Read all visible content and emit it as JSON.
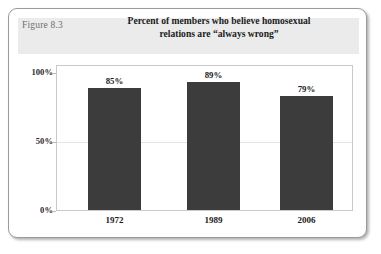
{
  "figure": {
    "label": "Figure 8.3",
    "title_line1": "Percent of members who believe homosexual",
    "title_line2": "relations are “always wrong”",
    "banner_color": "#ebebeb",
    "bar_color": "#3c3c3c",
    "card_border_color": "#9a9a9a"
  },
  "chart_data": {
    "type": "bar",
    "title": "Percent of members who believe homosexual relations are “always wrong”",
    "categories": [
      "1972",
      "1989",
      "2006"
    ],
    "values": [
      85,
      89,
      79
    ],
    "value_labels": [
      "85%",
      "89%",
      "79%"
    ],
    "xlabel": "",
    "ylabel": "",
    "ylim": [
      0,
      100
    ],
    "yticks": [
      0,
      50,
      100
    ],
    "ytick_labels": [
      "0%",
      "50%",
      "100%"
    ],
    "grid": true,
    "legend": false,
    "series": [
      {
        "name": "Percent always wrong",
        "values": [
          85,
          89,
          79
        ]
      }
    ]
  }
}
